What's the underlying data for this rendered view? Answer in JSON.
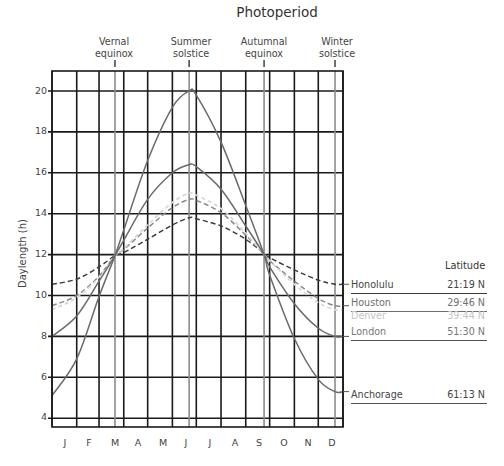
{
  "chart_data": {
    "type": "line",
    "title": "Photoperiod",
    "xlabel": "",
    "ylabel": "Daylength (h)",
    "ylim": [
      3.5,
      21
    ],
    "yticks": [
      4,
      6,
      8,
      10,
      12,
      14,
      16,
      18,
      20
    ],
    "grid": true,
    "x_categories": [
      "J",
      "F",
      "M",
      "A",
      "M",
      "J",
      "J",
      "A",
      "S",
      "O",
      "N",
      "D"
    ],
    "x_sample_days": [
      0,
      31,
      59,
      79,
      90,
      120,
      151,
      172,
      181,
      212,
      243,
      266,
      273,
      304,
      334,
      355,
      365
    ],
    "events": [
      {
        "label_line1": "Vernal",
        "label_line2": "equinox",
        "day": 79
      },
      {
        "label_line1": "Summer",
        "label_line2": "solstice",
        "day": 172
      },
      {
        "label_line1": "Autumnal",
        "label_line2": "equinox",
        "day": 266
      },
      {
        "label_line1": "Winter",
        "label_line2": "solstice",
        "day": 355
      }
    ],
    "series": [
      {
        "name": "Honolulu",
        "latitude": "21:19 N",
        "style": "dashed",
        "color": "#3c3c3c",
        "values": [
          10.55,
          10.8,
          11.4,
          11.95,
          12.1,
          12.75,
          13.45,
          13.8,
          13.75,
          13.4,
          12.75,
          12.05,
          11.85,
          11.25,
          10.75,
          10.55,
          10.55
        ]
      },
      {
        "name": "Houston",
        "latitude": "29:46 N",
        "style": "dashed",
        "color": "#8a8a8a",
        "values": [
          9.5,
          10.0,
          10.95,
          11.95,
          12.25,
          13.3,
          14.3,
          14.7,
          14.65,
          14.05,
          12.95,
          12.0,
          11.7,
          10.7,
          9.85,
          9.5,
          9.5
        ]
      },
      {
        "name": "Denver",
        "latitude": "39:44 N",
        "style": "dotted",
        "color": "#d8d8d8",
        "values": [
          9.3,
          9.9,
          10.9,
          11.95,
          12.3,
          13.45,
          14.55,
          15.0,
          14.9,
          14.25,
          13.05,
          12.0,
          11.7,
          10.55,
          9.65,
          9.3,
          9.3
        ]
      },
      {
        "name": "London",
        "latitude": "51:30 N",
        "style": "solid",
        "color": "#6a6a6a",
        "values": [
          8.0,
          9.0,
          10.7,
          11.95,
          12.7,
          14.7,
          16.0,
          16.4,
          16.3,
          15.2,
          13.4,
          12.0,
          11.4,
          9.6,
          8.4,
          8.0,
          8.0
        ]
      },
      {
        "name": "Anchorage",
        "latitude": "61:13 N",
        "style": "solid",
        "color": "#6a6a6a",
        "values": [
          5.1,
          6.9,
          9.95,
          11.95,
          13.2,
          16.6,
          19.2,
          20.0,
          19.8,
          17.5,
          14.4,
          12.0,
          11.0,
          7.9,
          5.9,
          5.3,
          5.3
        ]
      }
    ],
    "legend_position": "right",
    "legend_header": "Latitude"
  },
  "title": "Photoperiod",
  "ylabel": "Daylength (h)",
  "legend": {
    "header": "Latitude",
    "items": [
      {
        "name": "Honolulu",
        "latitude": "21:19 N"
      },
      {
        "name": "Houston",
        "latitude": "29:46 N"
      },
      {
        "name": "Denver",
        "latitude": "39:44 N"
      },
      {
        "name": "London",
        "latitude": "51:30 N"
      },
      {
        "name": "Anchorage",
        "latitude": "61:13 N"
      }
    ]
  },
  "events": [
    {
      "line1": "Vernal",
      "line2": "equinox"
    },
    {
      "line1": "Summer",
      "line2": "solstice"
    },
    {
      "line1": "Autumnal",
      "line2": "equinox"
    },
    {
      "line1": "Winter",
      "line2": "solstice"
    }
  ],
  "yticks": [
    "20",
    "18",
    "16",
    "14",
    "12",
    "10",
    "8",
    "6",
    "4"
  ],
  "months": [
    "J",
    "F",
    "M",
    "A",
    "M",
    "J",
    "J",
    "A",
    "S",
    "O",
    "N",
    "D"
  ]
}
